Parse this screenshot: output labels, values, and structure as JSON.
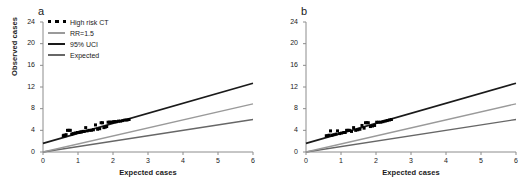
{
  "figure": {
    "panels": [
      {
        "id": "a",
        "label": "a",
        "has_legend": true,
        "has_y_title": true,
        "y_title": "Observed cases",
        "x_title": "Expected cases"
      },
      {
        "id": "b",
        "label": "b",
        "has_legend": false,
        "has_y_title": false,
        "y_title": "",
        "x_title": "Expected cases"
      }
    ],
    "legend": {
      "items": [
        {
          "label": "High risk CT",
          "style": "dots",
          "color": "#000000"
        },
        {
          "label": "RR=1.5",
          "style": "line",
          "color": "#9a9a9a"
        },
        {
          "label": "95% UCI",
          "style": "line",
          "color": "#1a1a1a"
        },
        {
          "label": "Expected",
          "style": "line",
          "color": "#676767"
        }
      ]
    },
    "colors": {
      "axis": "#8c8c8c",
      "text": "#1a1a1a",
      "marker": "#000000",
      "uci_line": "#1a1a1a",
      "rr_line": "#9a9a9a",
      "expected_line": "#676767",
      "background": "#ffffff"
    }
  },
  "chart_data": [
    {
      "type": "scatter",
      "panel": "a",
      "title": "a",
      "xlabel": "Expected cases",
      "ylabel": "Observed cases",
      "xlim": [
        0,
        6
      ],
      "ylim": [
        0,
        24
      ],
      "xticks": [
        0,
        1,
        2,
        3,
        4,
        5,
        6
      ],
      "yticks": [
        0,
        4,
        8,
        12,
        16,
        20,
        24
      ],
      "grid": false,
      "legend_position": "top-left",
      "series": [
        {
          "name": "High risk CT",
          "type": "scatter",
          "marker": "square",
          "color": "#000000",
          "points": [
            [
              0.58,
              3.0
            ],
            [
              0.6,
              3.1
            ],
            [
              0.63,
              3.0
            ],
            [
              0.66,
              3.2
            ],
            [
              0.7,
              4.0
            ],
            [
              0.74,
              4.0
            ],
            [
              0.78,
              4.0
            ],
            [
              0.82,
              3.3
            ],
            [
              0.86,
              3.4
            ],
            [
              0.92,
              3.5
            ],
            [
              0.98,
              3.6
            ],
            [
              1.02,
              3.6
            ],
            [
              1.06,
              3.7
            ],
            [
              1.1,
              3.7
            ],
            [
              1.14,
              3.8
            ],
            [
              1.18,
              3.8
            ],
            [
              1.22,
              4.5
            ],
            [
              1.26,
              3.9
            ],
            [
              1.32,
              4.0
            ],
            [
              1.38,
              4.0
            ],
            [
              1.44,
              4.1
            ],
            [
              1.5,
              5.0
            ],
            [
              1.56,
              4.2
            ],
            [
              1.62,
              4.3
            ],
            [
              1.66,
              5.4
            ],
            [
              1.7,
              5.4
            ],
            [
              1.74,
              4.5
            ],
            [
              1.78,
              4.6
            ],
            [
              1.82,
              4.7
            ],
            [
              1.86,
              5.5
            ],
            [
              1.9,
              5.5
            ],
            [
              1.94,
              5.5
            ],
            [
              1.98,
              5.5
            ],
            [
              2.02,
              5.6
            ],
            [
              2.06,
              5.6
            ],
            [
              2.1,
              5.6
            ],
            [
              2.16,
              5.7
            ],
            [
              2.22,
              5.7
            ],
            [
              2.28,
              5.8
            ],
            [
              2.34,
              5.9
            ],
            [
              2.4,
              5.9
            ],
            [
              2.46,
              6.0
            ]
          ]
        },
        {
          "name": "95% UCI",
          "type": "line",
          "color": "#1a1a1a",
          "x": [
            0,
            6
          ],
          "y": [
            1.6,
            12.7
          ],
          "intercept": 1.6,
          "slope": 1.85
        },
        {
          "name": "RR=1.5",
          "type": "line",
          "color": "#9a9a9a",
          "x": [
            0,
            6
          ],
          "y": [
            0,
            8.9
          ],
          "intercept": 0,
          "slope": 1.483
        },
        {
          "name": "Expected",
          "type": "line",
          "color": "#676767",
          "x": [
            0,
            6
          ],
          "y": [
            0,
            6.0
          ],
          "intercept": 0,
          "slope": 1.0
        }
      ]
    },
    {
      "type": "scatter",
      "panel": "b",
      "title": "b",
      "xlabel": "Expected cases",
      "ylabel": "",
      "xlim": [
        0,
        6
      ],
      "ylim": [
        0,
        24
      ],
      "xticks": [
        0,
        1,
        2,
        3,
        4,
        5,
        6
      ],
      "yticks": [
        0,
        4,
        8,
        12,
        16,
        20,
        24
      ],
      "grid": false,
      "legend_position": "none",
      "series": [
        {
          "name": "High risk CT",
          "type": "scatter",
          "marker": "square",
          "color": "#000000",
          "points": [
            [
              0.58,
              3.0
            ],
            [
              0.62,
              3.0
            ],
            [
              0.66,
              3.1
            ],
            [
              0.7,
              3.9
            ],
            [
              0.74,
              3.1
            ],
            [
              0.8,
              3.2
            ],
            [
              0.86,
              3.3
            ],
            [
              0.9,
              3.9
            ],
            [
              0.96,
              3.4
            ],
            [
              1.02,
              3.5
            ],
            [
              1.08,
              3.6
            ],
            [
              1.12,
              3.6
            ],
            [
              1.16,
              4.0
            ],
            [
              1.2,
              4.0
            ],
            [
              1.24,
              4.0
            ],
            [
              1.3,
              3.8
            ],
            [
              1.36,
              4.5
            ],
            [
              1.42,
              4.0
            ],
            [
              1.48,
              4.1
            ],
            [
              1.54,
              4.2
            ],
            [
              1.6,
              4.9
            ],
            [
              1.66,
              4.4
            ],
            [
              1.7,
              5.4
            ],
            [
              1.74,
              5.4
            ],
            [
              1.78,
              5.4
            ],
            [
              1.84,
              4.7
            ],
            [
              1.9,
              4.8
            ],
            [
              1.96,
              4.9
            ],
            [
              2.02,
              5.5
            ],
            [
              2.08,
              5.5
            ],
            [
              2.14,
              5.5
            ],
            [
              2.2,
              5.6
            ],
            [
              2.26,
              5.7
            ],
            [
              2.32,
              5.8
            ],
            [
              2.38,
              5.9
            ],
            [
              2.44,
              6.0
            ]
          ]
        },
        {
          "name": "95% UCI",
          "type": "line",
          "color": "#1a1a1a",
          "x": [
            0,
            6
          ],
          "y": [
            1.6,
            12.7
          ],
          "intercept": 1.6,
          "slope": 1.85
        },
        {
          "name": "RR=1.5",
          "type": "line",
          "color": "#9a9a9a",
          "x": [
            0,
            6
          ],
          "y": [
            0,
            8.9
          ],
          "intercept": 0,
          "slope": 1.483
        },
        {
          "name": "Expected",
          "type": "line",
          "color": "#676767",
          "x": [
            0,
            6
          ],
          "y": [
            0,
            6.0
          ],
          "intercept": 0,
          "slope": 1.0
        }
      ]
    }
  ]
}
